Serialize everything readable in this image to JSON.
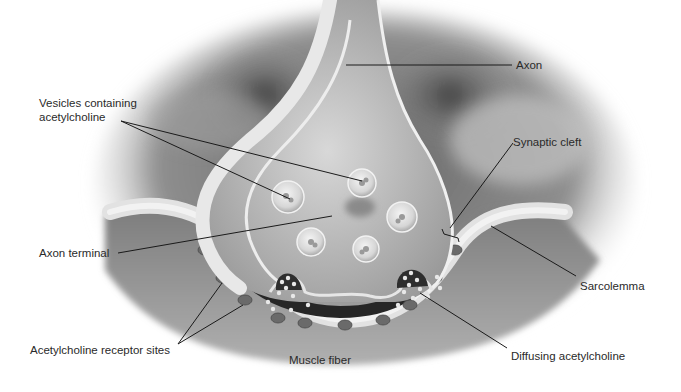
{
  "figure": {
    "colors": {
      "background": "#ffffff",
      "tissue_dark": "#5a5a5a",
      "tissue_mid": "#8a8a8a",
      "membrane_light": "#e6e6e6",
      "terminal_fill": "#b8b8b8",
      "cleft_dark": "#2a2a2a",
      "receptor": "#6e6e6e",
      "leader_line": "#1a1a1a",
      "label_text": "#2a2a2a"
    }
  },
  "labels": {
    "axon": "Axon",
    "vesicles_line1": "Vesicles containing",
    "vesicles_line2": "acetylcholine",
    "synaptic_cleft": "Synaptic cleft",
    "axon_terminal": "Axon terminal",
    "sarcolemma": "Sarcolemma",
    "receptor_sites": "Acetylcholine receptor sites",
    "muscle_fiber": "Muscle fiber",
    "diffusing_ach": "Diffusing acetylcholine"
  }
}
